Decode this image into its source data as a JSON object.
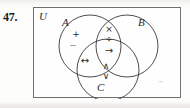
{
  "problem": {
    "number": "47."
  },
  "diagram": {
    "universe_label": "U",
    "set_labels": {
      "A": "A",
      "B": "B",
      "C": "C"
    },
    "stray_mark": "~",
    "regions": [
      {
        "region": "A-only",
        "symbols": [
          "+",
          "−"
        ]
      },
      {
        "region": "A-and-B",
        "symbols": [
          "×",
          "÷"
        ]
      },
      {
        "region": "A-and-B-and-C",
        "symbols": [
          "→"
        ]
      },
      {
        "region": "A-and-C",
        "symbols": [
          "↔"
        ]
      },
      {
        "region": "C-only",
        "symbols": [
          "∧",
          "∨"
        ]
      }
    ],
    "symbols": {
      "plus": "+",
      "minus": "−",
      "times": "×",
      "divide": "÷",
      "implies": "→",
      "iff": "↔",
      "and": "∧",
      "or": "∨"
    },
    "colors": {
      "ink": "#2c2c2c",
      "frame": "#6f6f6f",
      "paper": "#fefefe"
    }
  }
}
